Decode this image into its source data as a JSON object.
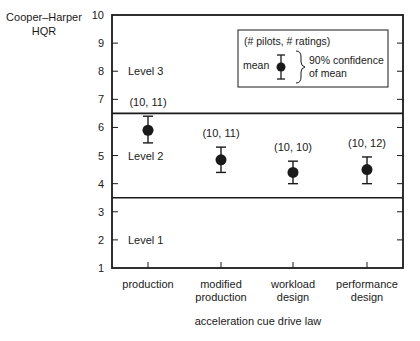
{
  "chart_data": {
    "type": "scatter",
    "title": "",
    "ylabel_line1": "Cooper–Harper",
    "ylabel_line2": "HQR",
    "xlabel": "acceleration cue drive law",
    "ylim": [
      1,
      10
    ],
    "yticks": [
      "1",
      "2",
      "3",
      "4",
      "5",
      "6",
      "7",
      "8",
      "9",
      "10"
    ],
    "grid": false,
    "categories": [
      {
        "line1": "production",
        "line2": ""
      },
      {
        "line1": "modified",
        "line2": "production"
      },
      {
        "line1": "workload",
        "line2": "design"
      },
      {
        "line1": "performance",
        "line2": "design"
      }
    ],
    "series": [
      {
        "name": "mean HQR with 90% confidence of mean",
        "points": [
          {
            "category": "production",
            "mean": 5.9,
            "ci_low": 5.45,
            "ci_high": 6.4,
            "label": "(10, 11)"
          },
          {
            "category": "modified production",
            "mean": 4.85,
            "ci_low": 4.4,
            "ci_high": 5.3,
            "label": "(10, 11)"
          },
          {
            "category": "workload design",
            "mean": 4.4,
            "ci_low": 4.0,
            "ci_high": 4.8,
            "label": "(10, 10)"
          },
          {
            "category": "performance design",
            "mean": 4.5,
            "ci_low": 4.0,
            "ci_high": 4.95,
            "label": "(10, 12)"
          }
        ]
      }
    ],
    "level_boundaries": [
      6.5,
      3.5
    ],
    "levels": [
      {
        "label": "Level 3",
        "y": 8
      },
      {
        "label": "Level 2",
        "y": 5
      },
      {
        "label": "Level 1",
        "y": 2
      }
    ],
    "legend": {
      "header": "(# pilots, # ratings)",
      "mean_label": "mean",
      "ci_line1": "90% confidence",
      "ci_line2": "of mean",
      "position": "upper right"
    }
  }
}
